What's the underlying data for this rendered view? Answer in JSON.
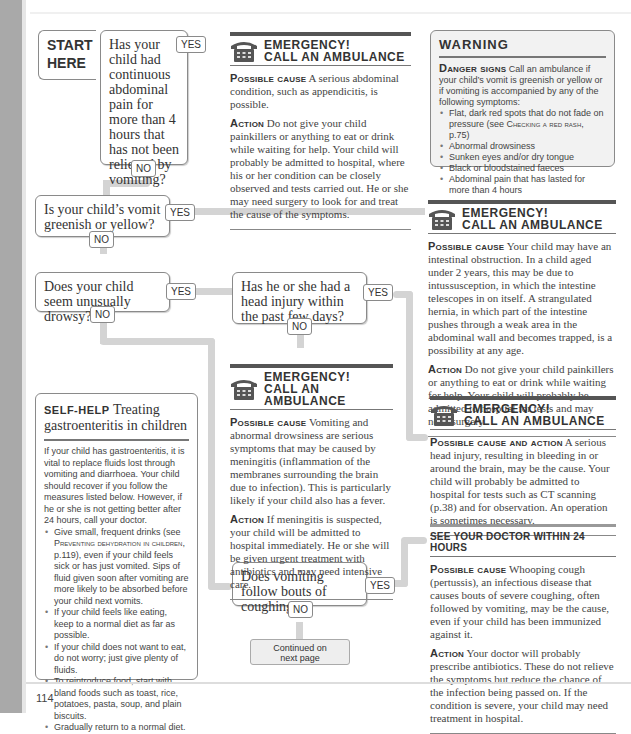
{
  "page_number": "114",
  "start": {
    "line1": "START",
    "line2": "HERE"
  },
  "labels": {
    "yes": "YES",
    "no": "NO"
  },
  "questions": {
    "q1": "Has your child had continuous abdominal pain for more than 4 hours that has not been relieved by vomiting?",
    "q2": "Is your child’s vomit greenish or yellow?",
    "q3": "Does your child seem unusually drowsy?",
    "q4": "Has he or she had a head injury within the past few days?",
    "q5": "Does vomiting follow bouts of coughing?"
  },
  "emergency_title_1": "EMERGENCY!",
  "emergency_title_2": "CALL AN AMBULANCE",
  "emergency_boxes": [
    {
      "cause_label": "Possible cause",
      "cause": "A serious abdominal condition, such as appendicitis, is possible.",
      "action_label": "Action",
      "action": "Do not give your child painkillers or anything to eat or drink while waiting for help. Your child will probably be admitted to hospital, where his or her condition can be closely observed and tests carried out. He or she may need surgery to look for and treat the cause of the symptoms."
    },
    {
      "cause_label": "Possible cause",
      "cause": "Your child may have an intestinal obstruction. In a child aged under 2 years, this may be due to intussusception, in which the intestine telescopes in on itself. A strangulated hernia, in which part of the intestine pushes through a weak area in the abdominal wall and becomes trapped, is a possibility at any age.",
      "action_label": "Action",
      "action": "Do not give your child painkillers or anything to eat or drink while waiting for help. Your child will probably be admitted to hospital for tests and may need surgery."
    },
    {
      "cause_label": "Possible cause",
      "cause": "Vomiting and abnormal drowsiness are serious symptoms that may be caused by meningitis (inflammation of the membranes surrounding the brain due to infection). This is particularly likely if your child also has a fever.",
      "action_label": "Action",
      "action": "If meningitis is suspected, your child will be admitted to hospital immediately. He or she will be given urgent treatment with antibiotics and may need intensive care."
    },
    {
      "cause_label": "Possible cause and action",
      "cause": "A serious head injury, resulting in bleeding in or around the brain, may be the cause. Your child will probably be admitted to hospital for tests such as CT scanning (p.38) and for observation. An operation is sometimes necessary."
    }
  ],
  "warning": {
    "title": "WARNING",
    "lead_label": "Danger signs",
    "lead": "Call an ambulance if your child’s vomit is greenish or yellow or if vomiting is accompanied by any of the following symptoms:",
    "items": [
      {
        "text": "Flat, dark red spots that do not fade on pressure (see ",
        "ref": "Checking a red rash",
        "after": ", p.75)"
      },
      {
        "text": "Abnormal drowsiness"
      },
      {
        "text": "Sunken eyes and/or dry tongue"
      },
      {
        "text": "Black or bloodstained faeces"
      },
      {
        "text": "Abdominal pain that has lasted for more than 4 hours"
      }
    ]
  },
  "self_help": {
    "kicker": "SELF-HELP",
    "title": "Treating gastroenteritis in children",
    "intro": "If your child has gastroenteritis, it is vital to replace fluids lost through vomiting and diarrhoea. Your child should recover if you follow the measures listed below. However, if he or she is not getting better after 24 hours, call your doctor.",
    "items": [
      {
        "text": "Give small, frequent drinks (see ",
        "ref": "Preventing dehydration in children",
        "after": ", p.119), even if your child feels sick or has just vomited. Sips of fluid given soon after vomiting are more likely to be absorbed before your child next vomits."
      },
      {
        "text": "If your child feels like eating, keep to a normal diet as far as possible."
      },
      {
        "text": "If your child does not want to eat, do not worry; just give plenty of fluids."
      },
      {
        "text": "To reintroduce food, start with bland foods such as toast, rice, potatoes, pasta, soup, and plain biscuits."
      },
      {
        "text": "Gradually return to a normal diet."
      }
    ]
  },
  "doctor": {
    "title": "SEE YOUR DOCTOR WITHIN 24 HOURS",
    "cause_label": "Possible cause",
    "cause": "Whooping cough (pertussis), an infectious disease that causes bouts of severe coughing, often followed by vomiting, may be the cause, even if your child has been immunized against it.",
    "action_label": "Action",
    "action": "Your doctor will probably prescribe antibiotics. These do not relieve the symptoms but reduce the chance of the infection being passed on. If the condition is severe, your child may need treatment in hospital."
  },
  "continued": {
    "line1": "Continued on",
    "line2": "next page"
  }
}
